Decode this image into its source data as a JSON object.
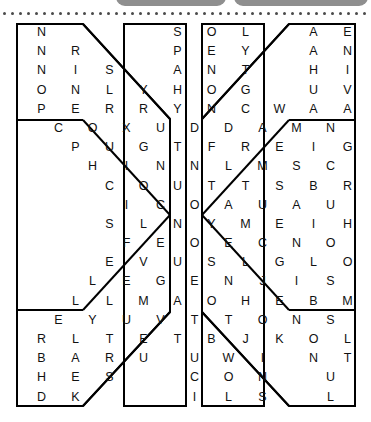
{
  "decor": {
    "topbar_left_label": "",
    "topbar_right_label": "",
    "bar_color": "#8f8f8f",
    "dot_color": "#4a4a4a",
    "dot_count": 46
  },
  "puzzle": {
    "type": "word-search",
    "shape": "butterfly",
    "rows": 20,
    "columns": 20,
    "letter_color": "#111111",
    "border_color": "#000000",
    "grid": [
      " N       S O L   A E F         G",
      " N R     P E Y   A N I       N N",
      " N I S   A N T   H I N      I E A",
      " O N L Y H O G   U V L     L Y Z Y",
      " P E R R Y N C W A A E  L H E O R",
      "  C O X U D D A M N L Y I U N L D",
      "   P U G T F R E I G H A I R B",
      "    H I N N L M S C E T N U",
      "     C O U T T S B R E N",
      "      I C O A U A U N",
      "     S L N Y M E I H",
      "      F E O E C N O T",
      "     E V U S L G L O D A",
      "    L E G E N J I S E S T N",
      "   L L M A O H E B M N E N O A",
      "  E Y U V T T O N S O I E B H U N",
      " R L T E T B J K O L E M E O C A",
      " B A R U  U W I  N T K   E S J E",
      " H E S    C O N   U Z R    L L R",
      " D K      I L S   L M O      C E"
    ],
    "rows_data": [
      {
        "left": "N",
        "midleft": "S O L",
        "midright": "A E F",
        "right": "G"
      },
      {
        "left": "N R",
        "midleft": "P E Y",
        "midright": "A N I",
        "right": "N N"
      },
      {
        "left": "N I S",
        "midleft": "A N T",
        "midright": "H I N",
        "right": "I E A"
      },
      {
        "left": "O N L Y",
        "midleft": "H O G",
        "midright": "U V L",
        "right": "L Y Z Y"
      },
      {
        "left": "P E R R Y",
        "midleft": "N C W",
        "midright": "A A E",
        "right": "L H E O R"
      },
      {
        "left": "",
        "midleft": "C O X U D D A M",
        "midright": "N L Y I U N L D",
        "right": ""
      },
      {
        "left": "",
        "midleft": "P U G T F R E",
        "midright": "I G H A I R B",
        "right": ""
      },
      {
        "left": "",
        "midleft": "H I N N L M",
        "midright": "S C E T N U",
        "right": ""
      },
      {
        "left": "",
        "midleft": "C O U T T",
        "midright": "S B R E N",
        "right": ""
      },
      {
        "left": "",
        "midleft": "I C O A",
        "midright": "U A U N",
        "right": ""
      },
      {
        "left": "",
        "midleft": "S L N Y",
        "midright": "M E I H",
        "right": ""
      },
      {
        "left": "",
        "midleft": "F E O E",
        "midright": "C N O T",
        "right": ""
      },
      {
        "left": "",
        "midleft": "E V U S L",
        "midright": "G L O D A",
        "right": ""
      },
      {
        "left": "",
        "midleft": "L E G E N J",
        "midright": "I S E S T N",
        "right": ""
      },
      {
        "left": "",
        "midleft": "L L M A O H E",
        "midright": "B M N E N O A",
        "right": ""
      },
      {
        "left": "",
        "midleft": "E Y U V T T O N",
        "midright": "S O I E B H U N",
        "right": ""
      },
      {
        "left": "R L T E T",
        "midleft": "B J K",
        "midright": "O L E",
        "right": "M E O C A"
      },
      {
        "left": "B A R U",
        "midleft": "U W I",
        "midright": "N T K",
        "right": "E S J E"
      },
      {
        "left": "H E S",
        "midleft": "C O N",
        "midright": "U Z R",
        "right": "L L R"
      },
      {
        "left": "D K",
        "midleft": "I L S",
        "midright": "L M O",
        "right": "C E"
      }
    ]
  }
}
